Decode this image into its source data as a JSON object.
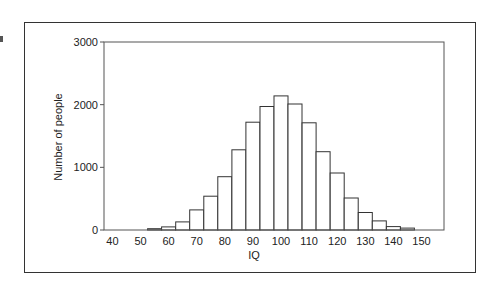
{
  "chart_data": {
    "type": "bar",
    "subtype": "histogram",
    "title": "",
    "xlabel": "IQ",
    "ylabel": "Number of people",
    "xlim": [
      37,
      158
    ],
    "ylim": [
      0,
      3000
    ],
    "x_ticks": [
      40,
      50,
      60,
      70,
      80,
      90,
      100,
      110,
      120,
      130,
      140,
      150
    ],
    "y_ticks": [
      0,
      1000,
      2000,
      3000
    ],
    "bin_width": 5,
    "grid": false,
    "legend": null,
    "categories": [
      55,
      60,
      65,
      70,
      75,
      80,
      85,
      90,
      95,
      100,
      105,
      110,
      115,
      120,
      125,
      130,
      135,
      140,
      145
    ],
    "values": [
      20,
      50,
      130,
      320,
      540,
      850,
      1280,
      1720,
      1970,
      2140,
      2010,
      1710,
      1250,
      910,
      510,
      280,
      145,
      55,
      30
    ],
    "bar_fill": "#ffffff",
    "bar_stroke": "#333333"
  }
}
